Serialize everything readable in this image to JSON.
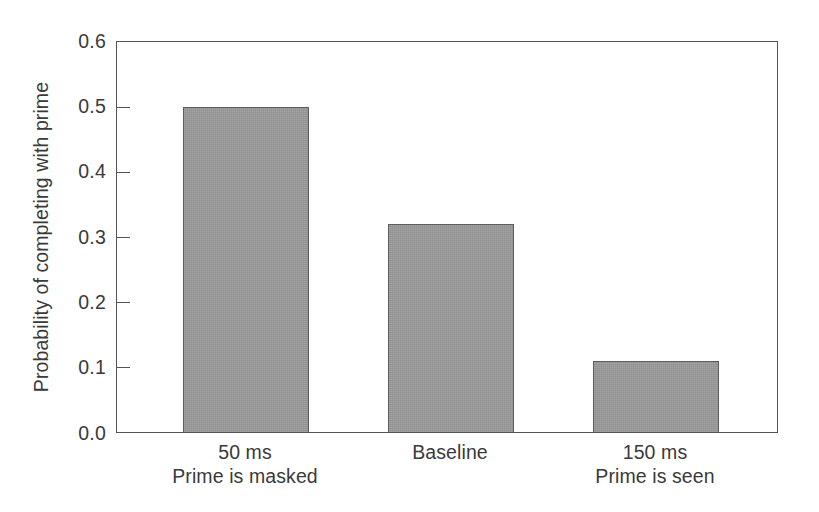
{
  "chart_data": {
    "type": "bar",
    "title": "",
    "xlabel": "",
    "ylabel": "Probability of completing with prime",
    "ylim": [
      0.0,
      0.6
    ],
    "ytick_values": [
      0.0,
      0.1,
      0.2,
      0.3,
      0.4,
      0.5,
      0.6
    ],
    "ytick_labels": [
      "0.0",
      "0.1",
      "0.2",
      "0.3",
      "0.4",
      "0.5",
      "0.6"
    ],
    "grid": false,
    "legend": false,
    "categories": [
      "50 ms",
      "Baseline",
      "150 ms"
    ],
    "category_sublabels": [
      "Prime is masked",
      "",
      "Prime is seen"
    ],
    "values": [
      0.5,
      0.32,
      0.11
    ],
    "bar_color": "#9a9a9a",
    "bar_edge_color": "#5d5d5d",
    "axis_color": "#555555",
    "text_color": "#3a3a3a",
    "background_color": "#ffffff"
  }
}
